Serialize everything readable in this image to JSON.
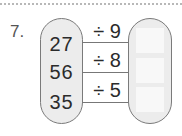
{
  "problem": {
    "number": "7.",
    "inputs": [
      "27",
      "56",
      "35"
    ],
    "operations": [
      "÷ 9",
      "÷ 8",
      "÷ 5"
    ],
    "answers": [
      "",
      "",
      ""
    ]
  },
  "colors": {
    "capsule_fill": "#ececec",
    "capsule_border": "#7a7a7a",
    "answer_box": "#f8f8f8",
    "arrow": "#777777",
    "divider": "#b8b8b8"
  },
  "icons": {
    "arrow": "right-arrow-icon"
  }
}
